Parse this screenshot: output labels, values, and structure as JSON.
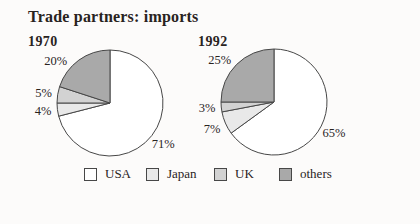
{
  "title": "Trade partners: imports",
  "chart_data": [
    {
      "type": "pie",
      "title": "1970",
      "categories": [
        "USA",
        "Japan",
        "UK",
        "others"
      ],
      "values": [
        71,
        4,
        5,
        20
      ],
      "slice_labels": [
        "71%",
        "4%",
        "5%",
        "20%"
      ],
      "unit": "%",
      "start_angle_deg": 0,
      "direction": "clockwise"
    },
    {
      "type": "pie",
      "title": "1992",
      "categories": [
        "USA",
        "Japan",
        "UK",
        "others"
      ],
      "values": [
        65,
        7,
        3,
        25
      ],
      "slice_labels": [
        "65%",
        "7%",
        "3%",
        "25%"
      ],
      "unit": "%",
      "start_angle_deg": 0,
      "direction": "clockwise"
    }
  ],
  "legend": {
    "position": "bottom",
    "items": [
      {
        "label": "USA",
        "color": "#ffffff"
      },
      {
        "label": "Japan",
        "color": "#e9e9e9"
      },
      {
        "label": "UK",
        "color": "#d2d2d2"
      },
      {
        "label": "others",
        "color": "#a9a9a9"
      }
    ]
  },
  "colors": {
    "outline": "#474747",
    "text": "#29231e",
    "background": "#fcfbfa"
  }
}
